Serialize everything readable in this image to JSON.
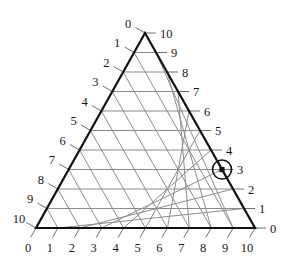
{
  "chart_data": {
    "type": "scatter",
    "title": "",
    "subtitle": "",
    "plot_style": "ternary-diagram",
    "grid": true,
    "legend": null,
    "axes": {
      "bottom": {
        "name": "bottom-axis",
        "label": "",
        "tick_labels": [
          "0",
          "1",
          "2",
          "3",
          "4",
          "5",
          "6",
          "7",
          "8",
          "9",
          "10"
        ],
        "direction": "left-to-right",
        "range": [
          0,
          10
        ],
        "tick_step": 1
      },
      "left": {
        "name": "left-axis",
        "label": "",
        "tick_labels": [
          "0",
          "1",
          "2",
          "3",
          "4",
          "5",
          "6",
          "7",
          "8",
          "9",
          "10"
        ],
        "direction": "top-to-bottom",
        "range": [
          0,
          10
        ],
        "tick_step": 1
      },
      "right": {
        "name": "right-axis",
        "label": "",
        "tick_labels": [
          "10",
          "9",
          "8",
          "7",
          "6",
          "5",
          "4",
          "3",
          "2",
          "1",
          "0"
        ],
        "direction": "top-to-bottom",
        "range": [
          0,
          10
        ],
        "tick_step": 1
      }
    },
    "points": [
      {
        "name": "highlighted-point",
        "label": "",
        "bottom": 3,
        "left": 7,
        "right": 3,
        "marker": "square",
        "highlight": "circle"
      }
    ],
    "colors": {
      "grid": "#8c8c8c",
      "outline": "#111111",
      "tick": "#6f6f6f",
      "text": "#1a1a1a",
      "marker": "#111111",
      "background": "#ffffff"
    }
  }
}
